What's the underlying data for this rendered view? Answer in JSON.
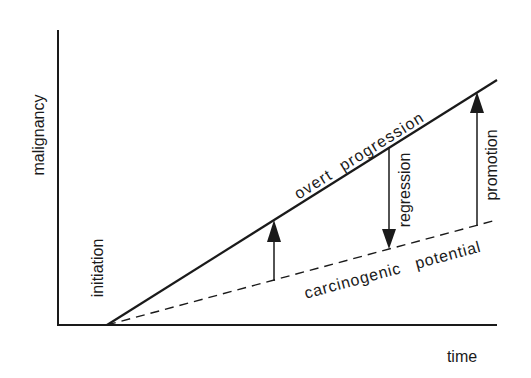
{
  "diagram": {
    "type": "conceptual line diagram",
    "axes": {
      "y_label": "malignancy",
      "x_label": "time"
    },
    "lines": {
      "overt": {
        "label": "overt progression",
        "style": "solid"
      },
      "potential": {
        "label": "carcinogenic potential",
        "style": "dashed"
      }
    },
    "annotations": {
      "initiation": "initiation",
      "regression": "regression",
      "promotion": "promotion"
    },
    "arrows": [
      {
        "name": "rise-arrow",
        "direction": "up",
        "from": "carcinogenic potential",
        "to": "overt progression"
      },
      {
        "name": "regression-arrow",
        "direction": "down",
        "from": "overt progression",
        "to": "carcinogenic potential"
      },
      {
        "name": "promotion-arrow",
        "direction": "up",
        "from": "carcinogenic potential",
        "to": "overt progression"
      }
    ],
    "colors": {
      "ink": "#1a1a1a",
      "background": "#ffffff"
    }
  }
}
